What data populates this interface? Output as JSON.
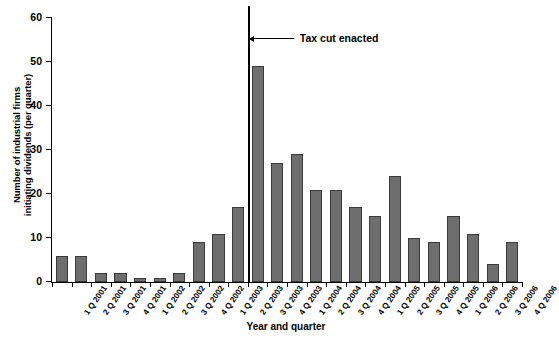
{
  "chart_data": {
    "type": "bar",
    "title": "",
    "xlabel": "Year and quarter",
    "ylabel": "Number of industrial firms initiating dividends (per quarter)",
    "ylabel_line1": "Number of industrial firms",
    "ylabel_line2": "initiating dividends (per quarter)",
    "ylim": [
      0,
      60
    ],
    "yticks": [
      0,
      10,
      20,
      30,
      40,
      50,
      60
    ],
    "grid": false,
    "legend": null,
    "bar_color": "#6e6e6e",
    "bar_edge_color": "#3a3a3a",
    "categories": [
      "1 Q 2001",
      "2 Q 2001",
      "3 Q 2001",
      "4 Q 2001",
      "1 Q 2002",
      "2 Q 2002",
      "3 Q 2002",
      "4 Q 2002",
      "1 Q 2003",
      "2 Q 2003",
      "3 Q 2003",
      "4 Q 2003",
      "1 Q 2004",
      "2 Q 2004",
      "3 Q 2004",
      "4 Q 2004",
      "1 Q 2005",
      "2 Q 2005",
      "3 Q 2005",
      "4 Q 2005",
      "1 Q 2006",
      "2 Q 2006",
      "3 Q 2006",
      "4 Q 2006"
    ],
    "values": [
      6,
      6,
      2,
      2,
      1,
      1,
      2,
      9,
      11,
      17,
      49,
      27,
      29,
      21,
      21,
      17,
      15,
      24,
      10,
      9,
      15,
      11,
      4,
      9
    ],
    "annotations": [
      {
        "text": "Tax cut enacted",
        "type": "vertical-line-with-arrow-label",
        "at_category_boundary": "between 2 Q 2003 and 3 Q 2003",
        "boundary_index": 10
      }
    ]
  }
}
